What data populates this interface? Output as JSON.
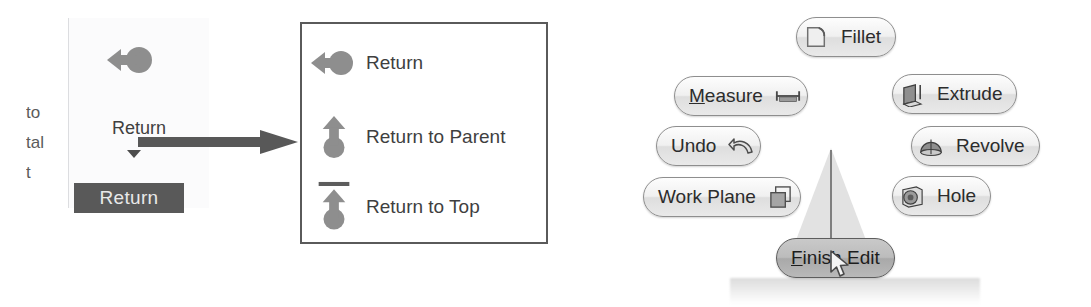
{
  "ribbon": {
    "clipped_labels": [
      "to",
      "tal",
      "t"
    ],
    "button_label": "Return",
    "button_icon": "return-arrow-circle-icon",
    "dropdown_arrow_icon": "chevron-down-icon",
    "tooltip_label": "Return"
  },
  "connector": {
    "icon": "right-arrow-annotation"
  },
  "dropdown_menu": {
    "items": [
      {
        "label": "Return",
        "icon": "return-left-arrow-circle-icon"
      },
      {
        "label": "Return to Parent",
        "icon": "return-up-arrow-circle-icon"
      },
      {
        "label": "Return to Top",
        "icon": "return-up-arrow-circle-bar-icon"
      }
    ]
  },
  "marking_menu": {
    "gesture_icon": "gesture-trail-cone",
    "cursor_icon": "mouse-pointer-icon",
    "reflection_text": "",
    "items": [
      {
        "id": "fillet",
        "label": "Fillet",
        "icon": "fillet-icon",
        "icon_side": "left",
        "accel": "",
        "selected": false
      },
      {
        "id": "measure",
        "label": "Measure",
        "icon": "measure-ruler-icon",
        "icon_side": "right",
        "accel": "M",
        "selected": false
      },
      {
        "id": "undo",
        "label": "Undo",
        "icon": "undo-arrow-icon",
        "icon_side": "right",
        "accel": "",
        "selected": false
      },
      {
        "id": "work-plane",
        "label": "Work Plane",
        "icon": "work-plane-icon",
        "icon_side": "right",
        "accel": "",
        "selected": false
      },
      {
        "id": "extrude",
        "label": "Extrude",
        "icon": "extrude-icon",
        "icon_side": "left",
        "accel": "",
        "selected": false
      },
      {
        "id": "revolve",
        "label": "Revolve",
        "icon": "revolve-icon",
        "icon_side": "left",
        "accel": "",
        "selected": false
      },
      {
        "id": "hole",
        "label": "Hole",
        "icon": "hole-icon",
        "icon_side": "left",
        "accel": "",
        "selected": false
      },
      {
        "id": "finish-edit",
        "label": "Finish Edit",
        "icon": "",
        "icon_side": "none",
        "accel": "F",
        "selected": true
      }
    ]
  },
  "colors": {
    "ink": "#3a3a3a",
    "icon_gray": "#8c8c8c",
    "tooltip_bg": "#595959",
    "selected_pill": "#b5b5b5",
    "menu_border": "#5a5a5a"
  }
}
